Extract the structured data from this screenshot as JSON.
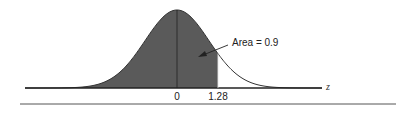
{
  "chart_data": {
    "type": "area",
    "title": "",
    "xlabel": "z",
    "ylabel": "",
    "tick_labels": [
      "0",
      "1.28"
    ],
    "ticks": [
      0,
      1.28
    ],
    "shaded_region": {
      "from": "-inf",
      "to": 1.28,
      "area": 0.9
    },
    "annotation": "Area = 0.9",
    "colors": {
      "shade": "#5a5a5a",
      "curve": "#333333",
      "axis": "#222222"
    },
    "grid": false
  }
}
